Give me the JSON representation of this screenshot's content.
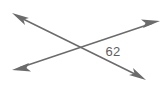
{
  "figure": {
    "type": "geometry-diagram",
    "background_color": "#ffffff",
    "stroke_color": "#6b6b6b",
    "label_color": "#5e5e5e",
    "stroke_width": 1.5,
    "width": 168,
    "height": 90
  },
  "labels": {
    "angle_measure": "62"
  },
  "geometry": {
    "intersection": {
      "x": 78,
      "y": 45
    },
    "lines": [
      {
        "name": "line-falling",
        "from": {
          "x": 12,
          "y": 13
        },
        "to": {
          "x": 146,
          "y": 80
        },
        "arrow_start": true,
        "arrow_end": true
      },
      {
        "name": "line-rising",
        "from": {
          "x": 12,
          "y": 70
        },
        "to": {
          "x": 160,
          "y": 21
        },
        "arrow_start": true,
        "arrow_end": true
      }
    ],
    "label_position": {
      "x": 113,
      "y": 51
    }
  }
}
